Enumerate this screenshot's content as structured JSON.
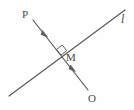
{
  "figure": {
    "type": "geometry-diagram",
    "width": 134,
    "height": 110,
    "background_color": "#fefefe",
    "stroke_color": "#5a5a5a",
    "labels": {
      "point_p": "P",
      "point_m": "M",
      "point_o": "O",
      "line_l": "l"
    },
    "points": {
      "P": {
        "x": 33,
        "y": 20
      },
      "M": {
        "x": 62,
        "y": 54
      },
      "O": {
        "x": 88,
        "y": 90
      },
      "l_start": {
        "x": 9,
        "y": 96
      },
      "l_end": {
        "x": 125,
        "y": 10
      }
    },
    "segments": [
      {
        "name": "segment-PO",
        "from": "P",
        "to": "O",
        "tick_marks": 2,
        "tick_positions": [
          {
            "x": 46,
            "y": 36
          },
          {
            "x": 74,
            "y": 70
          }
        ]
      },
      {
        "name": "line-l",
        "from": "l_start",
        "to": "l_end",
        "tick_marks": 0
      }
    ],
    "right_angle": {
      "name": "right-angle-marker",
      "vertex": {
        "x": 62,
        "y": 54
      },
      "size": 7,
      "shown": true
    }
  }
}
